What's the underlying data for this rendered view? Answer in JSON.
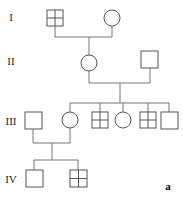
{
  "figure": {
    "panel_label": "a",
    "type": "pedigree-chart",
    "line_color": "#777777",
    "symbol_stroke_color": "#555555",
    "symbol_fill_color": "#ffffff",
    "text_color": "#222222"
  },
  "generations": [
    {
      "id": "I",
      "label": "I",
      "label_x": 11,
      "label_y": 21
    },
    {
      "id": "II",
      "label": "II",
      "label_x": 10,
      "label_y": 65
    },
    {
      "id": "III",
      "label": "III",
      "label_x": 8,
      "label_y": 125
    },
    {
      "id": "IV",
      "label": "IV",
      "label_x": 8,
      "label_y": 183
    }
  ],
  "individuals": [
    {
      "name": "i-1",
      "generation": "I",
      "sex": "male",
      "shape": "square",
      "pattern": "quartered",
      "cx": 55,
      "cy": 18,
      "size": 16
    },
    {
      "name": "i-2",
      "generation": "I",
      "sex": "female",
      "shape": "circle",
      "pattern": "plain",
      "cx": 112,
      "cy": 18,
      "size": 16
    },
    {
      "name": "ii-1",
      "generation": "II",
      "sex": "female",
      "shape": "circle",
      "pattern": "plain",
      "cx": 89,
      "cy": 63,
      "size": 16
    },
    {
      "name": "ii-2",
      "generation": "II",
      "sex": "male",
      "shape": "square",
      "pattern": "plain",
      "cx": 150,
      "cy": 59,
      "size": 17
    },
    {
      "name": "iii-1",
      "generation": "III",
      "sex": "male",
      "shape": "square",
      "pattern": "plain",
      "cx": 33,
      "cy": 120,
      "size": 17
    },
    {
      "name": "iii-2",
      "generation": "III",
      "sex": "female",
      "shape": "circle",
      "pattern": "plain",
      "cx": 70,
      "cy": 120,
      "size": 16
    },
    {
      "name": "iii-3",
      "generation": "III",
      "sex": "male",
      "shape": "square",
      "pattern": "quartered",
      "cx": 100,
      "cy": 120,
      "size": 16
    },
    {
      "name": "iii-4",
      "generation": "III",
      "sex": "female",
      "shape": "circle",
      "pattern": "plain",
      "cx": 123,
      "cy": 120,
      "size": 16
    },
    {
      "name": "iii-5",
      "generation": "III",
      "sex": "male",
      "shape": "square",
      "pattern": "quartered",
      "cx": 148,
      "cy": 120,
      "size": 16
    },
    {
      "name": "iii-6",
      "generation": "III",
      "sex": "male",
      "shape": "square",
      "pattern": "plain",
      "cx": 169,
      "cy": 120,
      "size": 17
    },
    {
      "name": "iv-1",
      "generation": "IV",
      "sex": "male",
      "shape": "square",
      "pattern": "plain",
      "cx": 34,
      "cy": 178,
      "size": 17
    },
    {
      "name": "iv-2",
      "generation": "IV",
      "sex": "male",
      "shape": "square",
      "pattern": "quartered",
      "cx": 78,
      "cy": 178,
      "size": 17
    }
  ],
  "matings": [
    {
      "name": "mating-i",
      "partners": [
        "i-1",
        "i-2"
      ],
      "couple_line_y": 37,
      "left_x": 55,
      "right_x": 112,
      "sibship_x": 89,
      "sibship_y": 55,
      "children": [
        "ii-1"
      ]
    },
    {
      "name": "mating-ii",
      "partners": [
        "ii-1",
        "ii-2"
      ],
      "couple_line_y": 83,
      "left_x": 89,
      "right_x": 150,
      "sibship_x": 120,
      "sibship_y": 103,
      "children": [
        "iii-2",
        "iii-3",
        "iii-4",
        "iii-5",
        "iii-6"
      ]
    },
    {
      "name": "mating-iii",
      "partners": [
        "iii-1",
        "iii-2"
      ],
      "couple_line_y": 143,
      "left_x": 33,
      "right_x": 70,
      "sibship_x": 52,
      "sibship_y": 160,
      "children": [
        "iv-1",
        "iv-2"
      ]
    }
  ]
}
